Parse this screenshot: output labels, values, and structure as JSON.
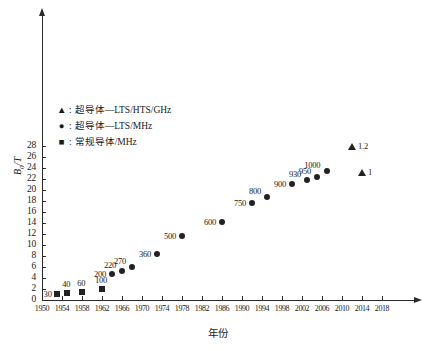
{
  "chart_data": {
    "type": "scatter",
    "title": "",
    "xlabel": "年份",
    "ylabel": "B0/T",
    "ylabel_base": "B",
    "ylabel_sub": "0",
    "ylabel_unit": "/T",
    "xlim": [
      1950,
      2020
    ],
    "ylim": [
      0,
      29
    ],
    "grid": false,
    "legend_position": "upper-left-inside",
    "xticks": [
      "1950",
      "1954",
      "1958",
      "1962",
      "1966",
      "1970",
      "1974",
      "1978",
      "1982",
      "1986",
      "1990",
      "1994",
      "1998",
      "2002",
      "2006",
      "2010",
      "2014",
      "2018"
    ],
    "yticks": [
      "0",
      "2",
      "4",
      "6",
      "8",
      "10",
      "12",
      "14",
      "16",
      "18",
      "20",
      "22",
      "24",
      "26",
      "28"
    ],
    "legend": [
      {
        "marker": "triangle",
        "symbol": "▲",
        "label": "超导体—LTS/HTS/GHz"
      },
      {
        "marker": "circle",
        "symbol": "●",
        "label": "超导体—LTS/MHz"
      },
      {
        "marker": "square",
        "symbol": "■",
        "label": "常规导体/MHz"
      }
    ],
    "series": [
      {
        "name": "常规导体/MHz",
        "marker": "square",
        "points": [
          {
            "x": 1953,
            "y": 1.1,
            "label": "30",
            "label_pos": "left"
          },
          {
            "x": 1955,
            "y": 1.2,
            "label": "40",
            "label_pos": "top"
          },
          {
            "x": 1958,
            "y": 1.5,
            "label": "60",
            "label_pos": "top"
          },
          {
            "x": 1962,
            "y": 2.0,
            "label": "100",
            "label_pos": "top"
          }
        ]
      },
      {
        "name": "超导体—LTS/MHz",
        "marker": "circle",
        "points": [
          {
            "x": 1964,
            "y": 4.7,
            "label": "200",
            "label_pos": "left"
          },
          {
            "x": 1966,
            "y": 5.2,
            "label": "220",
            "label_pos": "topleft"
          },
          {
            "x": 1968,
            "y": 6.0,
            "label": "270",
            "label_pos": "topleft"
          },
          {
            "x": 1973,
            "y": 8.4,
            "label": "360",
            "label_pos": "left"
          },
          {
            "x": 1978,
            "y": 11.7,
            "label": "500",
            "label_pos": "left"
          },
          {
            "x": 1986,
            "y": 14.1,
            "label": "600",
            "label_pos": "left"
          },
          {
            "x": 1992,
            "y": 17.6,
            "label": "750",
            "label_pos": "left"
          },
          {
            "x": 1995,
            "y": 18.8,
            "label": "800",
            "label_pos": "topleft"
          },
          {
            "x": 2000,
            "y": 21.1,
            "label": "900",
            "label_pos": "left"
          },
          {
            "x": 2003,
            "y": 21.9,
            "label": "930",
            "label_pos": "topleft"
          },
          {
            "x": 2005,
            "y": 22.3,
            "label": "950",
            "label_pos": "topleft"
          },
          {
            "x": 2007,
            "y": 23.5,
            "label": "1000",
            "label_pos": "topleft"
          }
        ]
      },
      {
        "name": "超导体—LTS/HTS/GHz",
        "marker": "triangle",
        "points": [
          {
            "x": 2012,
            "y": 28.0,
            "label": "1.2",
            "label_pos": "right"
          },
          {
            "x": 2014,
            "y": 23.2,
            "label": "1",
            "label_pos": "right"
          }
        ]
      }
    ]
  }
}
